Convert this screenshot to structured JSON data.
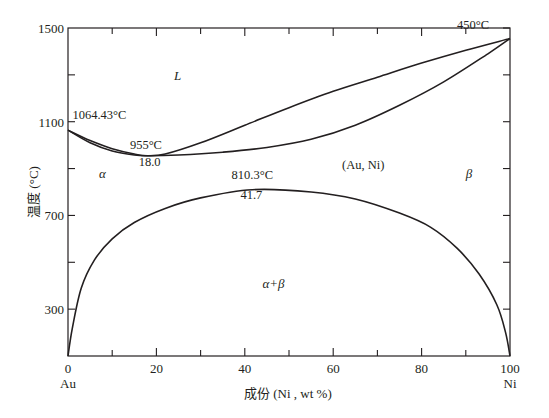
{
  "chart_data": {
    "type": "line",
    "title": "",
    "xlabel": "成份 (Ni , wt %)",
    "ylabel": "温度 (°C)",
    "xlim": [
      0,
      100
    ],
    "ylim": [
      100,
      1500
    ],
    "grid": false,
    "x_ticks": [
      "0",
      "20",
      "40",
      "60",
      "80",
      "100"
    ],
    "x_minor_ticks": [
      10,
      30,
      50,
      70,
      90
    ],
    "x_end_labels": {
      "left": "Au",
      "right": "Ni"
    },
    "y_ticks": [
      "300",
      "700",
      "1100",
      "1500"
    ],
    "y_minor_ticks": [
      500,
      900,
      1300
    ],
    "series": [
      {
        "name": "liquidus",
        "x": [
          0,
          5,
          10,
          15,
          18,
          22,
          30,
          40,
          50,
          60,
          70,
          80,
          90,
          100
        ],
        "y": [
          1064,
          1020,
          985,
          962,
          955,
          962,
          1010,
          1085,
          1160,
          1230,
          1290,
          1350,
          1405,
          1455
        ]
      },
      {
        "name": "solidus",
        "x": [
          0,
          5,
          10,
          15,
          18,
          25,
          35,
          45,
          55,
          65,
          75,
          85,
          95,
          100
        ],
        "y": [
          1064,
          1010,
          975,
          958,
          955,
          958,
          970,
          990,
          1025,
          1085,
          1170,
          1270,
          1390,
          1455
        ]
      },
      {
        "name": "miscibility_gap",
        "x": [
          0,
          1,
          3,
          6,
          10,
          15,
          22,
          30,
          41.7,
          55,
          65,
          75,
          82,
          88,
          93,
          97,
          99,
          100
        ],
        "y": [
          100,
          220,
          390,
          510,
          600,
          670,
          730,
          775,
          810,
          800,
          770,
          710,
          650,
          560,
          450,
          320,
          200,
          100
        ]
      }
    ],
    "annotations": [
      {
        "text": "1064.43°C",
        "x": 1,
        "y": 1110
      },
      {
        "text": "955°C",
        "x": 14,
        "y": 985
      },
      {
        "text": "18.0",
        "x": 16,
        "y": 910
      },
      {
        "text": "450°C",
        "x": 88,
        "y": 1495
      },
      {
        "text": "810.3°C",
        "x": 37,
        "y": 855
      },
      {
        "text": "41.7",
        "x": 39,
        "y": 770
      }
    ],
    "phase_labels": [
      {
        "text": "L",
        "x": 24,
        "y": 1280
      },
      {
        "text": "α",
        "x": 7,
        "y": 860
      },
      {
        "text": "β",
        "x": 90,
        "y": 860
      },
      {
        "text": "(Au, Ni)",
        "x": 62,
        "y": 900
      },
      {
        "text": "α+β",
        "x": 44,
        "y": 390
      }
    ]
  }
}
